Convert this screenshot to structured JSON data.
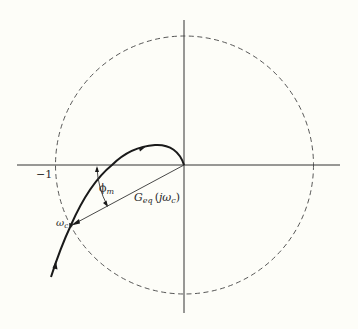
{
  "figure": {
    "type": "Nyquist plot with unit circle",
    "background": "#fdfdf8",
    "ink": "#2a2a2a",
    "labels": {
      "minus_one": "−1",
      "phase_margin_symbol": "ϕ",
      "phase_margin_sub": "m",
      "crossover_symbol": "ω",
      "crossover_sub": "c",
      "vector_G": "G",
      "vector_sub": "eq",
      "vector_arg_open": "(",
      "vector_arg_j": "jω",
      "vector_arg_sub": "c",
      "vector_arg_close": ")"
    },
    "elements": {
      "real_axis": {
        "x1": 17,
        "x2": 340,
        "y": 165
      },
      "imag_axis": {
        "x": 184,
        "y1": 20,
        "y2": 313
      },
      "unit_circle": {
        "cx": 184.5,
        "cy": 165,
        "r": 129,
        "style": "dashed"
      },
      "nyquist_curve": {
        "start": [
          51,
          277
        ],
        "crossover_point": [
          71,
          225
        ],
        "real_axis_crossing": [
          112,
          165
        ],
        "peak": [
          155,
          145
        ],
        "end": [
          184,
          165
        ]
      },
      "vector_line": {
        "from": [
          184,
          165
        ],
        "to": [
          71,
          225
        ]
      }
    }
  }
}
